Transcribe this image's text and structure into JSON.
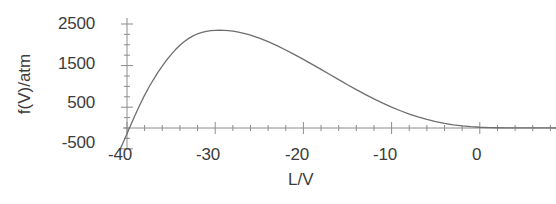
{
  "chart_data": {
    "type": "line",
    "title": "",
    "xlabel": "L/V",
    "ylabel": "f(V)/atm",
    "xlim": [
      -40.9,
      -31.1
    ],
    "ylim": [
      -500,
      2500
    ],
    "xlim_display": [
      -40.9,
      8.8
    ],
    "grid": false,
    "legend": null,
    "x_ticks": [
      -40,
      -30,
      -20,
      -10,
      0
    ],
    "x_tick_labels": [
      "-40",
      "-30",
      "-20",
      "-10",
      "0"
    ],
    "x_minor_tick_step": 2,
    "y_ticks": [
      -500,
      500,
      1500,
      2500
    ],
    "y_tick_labels": [
      "-500",
      "500",
      "1500",
      "2500"
    ],
    "y_minor_tick_step": 250,
    "line_color": "#6e6e6e",
    "axis_color": "#8c8c8c",
    "background_color": "#ffffff",
    "series": [
      {
        "name": "f(V)",
        "x": [
          -40.8,
          -40.4,
          -40.0,
          -39.6,
          -39.2,
          -38.8,
          -38.4,
          -38.0,
          -37.5,
          -37.0,
          -36.5,
          -36.0,
          -35.5,
          -35.0,
          -34.5,
          -34.0,
          -33.5,
          -33.0,
          -32.5,
          -32.0,
          -31.5,
          -31.0,
          -30.5,
          -30.0,
          -29.5,
          -29.0,
          -28.5,
          -28.0,
          -27.5,
          -27.0,
          -26.5,
          -26.0,
          -25.5,
          -25.0,
          -24.0,
          -23.0,
          -22.0,
          -21.0,
          -20.0,
          -19.0,
          -18.0,
          -17.0,
          -16.0,
          -15.0,
          -14.0,
          -13.0,
          -12.0,
          -11.0,
          -10.0,
          -9.0,
          -8.0,
          -7.0,
          -6.0,
          -5.0,
          -4.0,
          -3.0,
          -2.0,
          -1.0,
          0.0,
          1.0,
          2.0,
          3.0,
          4.0,
          5.0,
          6.0,
          7.0,
          8.0,
          8.8
        ],
        "y": [
          -520,
          -330,
          -140,
          60,
          255,
          440,
          620,
          790,
          985,
          1165,
          1335,
          1490,
          1635,
          1765,
          1885,
          1990,
          2080,
          2155,
          2215,
          2265,
          2300,
          2325,
          2340,
          2348,
          2350,
          2348,
          2340,
          2328,
          2310,
          2288,
          2262,
          2232,
          2198,
          2160,
          2075,
          1980,
          1875,
          1765,
          1650,
          1530,
          1408,
          1285,
          1162,
          1040,
          922,
          808,
          700,
          598,
          502,
          415,
          336,
          266,
          205,
          153,
          110,
          76,
          50,
          31,
          18,
          10,
          6,
          4,
          2,
          2,
          1,
          1,
          1,
          0
        ]
      }
    ]
  },
  "axis_labels": {
    "y": [
      {
        "text": "2500",
        "top": 14,
        "right": 95
      },
      {
        "text": "1500",
        "top": 54,
        "right": 95
      },
      {
        "text": "500",
        "top": 93,
        "right": 95
      },
      {
        "text": "-500",
        "top": 133,
        "right": 95
      }
    ],
    "x": [
      {
        "text": "-40",
        "left": 125,
        "top": 145
      },
      {
        "text": "-30",
        "left": 213,
        "top": 145
      },
      {
        "text": "-20",
        "left": 302,
        "top": 145
      },
      {
        "text": "-10",
        "left": 390,
        "top": 145
      },
      {
        "text": "0",
        "left": 478,
        "top": 145
      }
    ]
  },
  "titles": {
    "x_axis": "L/V",
    "y_axis": "f(V)/atm"
  }
}
